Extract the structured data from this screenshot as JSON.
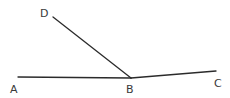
{
  "diagram": {
    "type": "geometry-angles",
    "points": {
      "A": {
        "label": "A",
        "x": 18,
        "y": 77
      },
      "B": {
        "label": "B",
        "x": 131,
        "y": 78
      },
      "C": {
        "label": "C",
        "x": 216,
        "y": 71
      },
      "D": {
        "label": "D",
        "x": 53,
        "y": 17
      }
    },
    "segments": [
      {
        "from": "A",
        "to": "B"
      },
      {
        "from": "B",
        "to": "C"
      },
      {
        "from": "B",
        "to": "D"
      }
    ],
    "labels": {
      "A": "A",
      "B": "B",
      "C": "C",
      "D": "D"
    },
    "colors": {
      "line": "#2b2b2b",
      "label": "#3a3a3a",
      "background": "#ffffff"
    }
  }
}
